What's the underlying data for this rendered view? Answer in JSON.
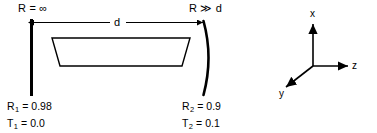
{
  "figure": {
    "kind": "optical-resonator-cavity-diagram",
    "background_color": "#ffffff",
    "stroke_color": "#000000"
  },
  "mirrors": {
    "left": {
      "shape_name": "flat-mirror",
      "curvature_label": "R = ∞",
      "reflectivity_label_prefix": "R",
      "reflectivity_subscript": "1",
      "reflectivity_value": "= 0.98",
      "transmission_label_prefix": "T",
      "transmission_subscript": "1",
      "transmission_value": "= 0.0"
    },
    "right": {
      "shape_name": "curved-mirror",
      "curvature_label": "R ≫ d",
      "reflectivity_label_prefix": "R",
      "reflectivity_subscript": "2",
      "reflectivity_value": "= 0.9",
      "transmission_label_prefix": "T",
      "transmission_subscript": "2",
      "transmission_value": "= 0.1"
    }
  },
  "dimension": {
    "label": "d",
    "description": "cavity length between mirrors"
  },
  "gain_medium": {
    "shape_name": "trapezoid-brewster-slab"
  },
  "axes": {
    "x_label": "x",
    "y_label": "y",
    "z_label": "z"
  }
}
